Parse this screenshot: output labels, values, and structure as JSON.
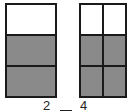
{
  "diagram": {
    "left_model": {
      "rows": 3,
      "cols": 1,
      "cells": [
        "white",
        "shaded",
        "shaded"
      ],
      "shaded_count": 2,
      "label": "2"
    },
    "right_model": {
      "rows": 3,
      "cols": 2,
      "cells": [
        "white",
        "white",
        "shaded",
        "shaded",
        "shaded",
        "shaded"
      ],
      "shaded_count": 4,
      "label": "4"
    },
    "comparison_blank": "_",
    "colors": {
      "border": "#1a1a1a",
      "shaded": "#8a8a8a",
      "unshaded": "#ffffff"
    }
  }
}
